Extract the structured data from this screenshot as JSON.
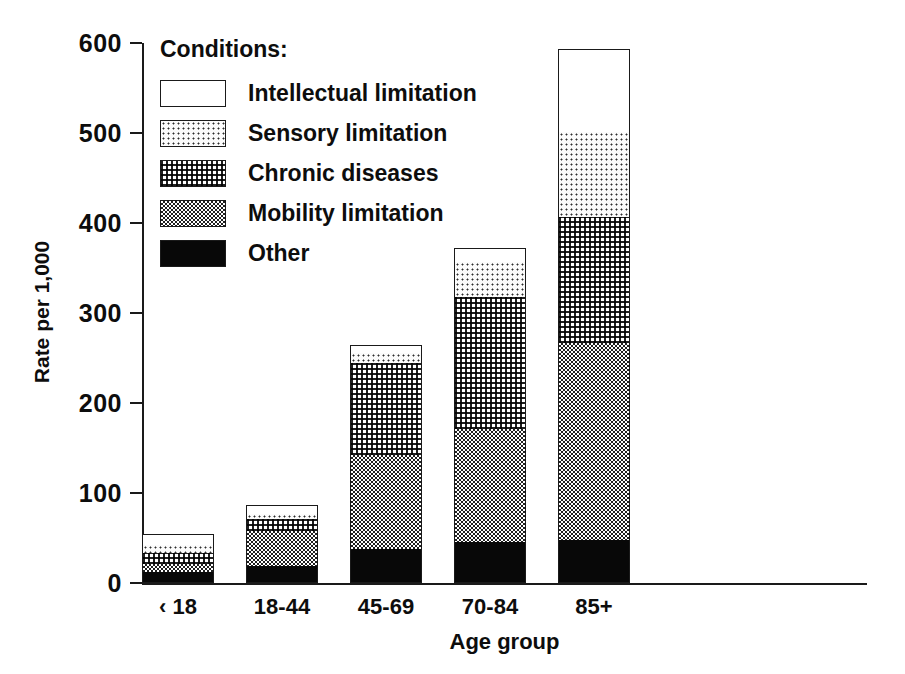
{
  "chart_data": {
    "type": "bar",
    "stacked": true,
    "title": "",
    "xlabel": "Age group",
    "ylabel": "Rate per 1,000",
    "categories": [
      "‹ 18",
      "18-44",
      "45-69",
      "70-84",
      "85+"
    ],
    "ylim": [
      0,
      600
    ],
    "yticks": [
      0,
      100,
      200,
      300,
      400,
      500,
      600
    ],
    "ytick_labels": [
      "0",
      "100",
      "200",
      "300",
      "400",
      "500",
      "600"
    ],
    "grid": false,
    "legend_title": "Conditions:",
    "legend_position": "top-left-inside",
    "series": [
      {
        "name": "Other",
        "pattern": "solid-black",
        "values": [
          12,
          19,
          38,
          46,
          48
        ]
      },
      {
        "name": "Mobility limitation",
        "pattern": "dense-checker",
        "values": [
          9,
          39,
          104,
          125,
          219
        ]
      },
      {
        "name": "Chronic diseases",
        "pattern": "dot-grid",
        "values": [
          12,
          13,
          102,
          147,
          140
        ]
      },
      {
        "name": "Sensory limitation",
        "pattern": "light-dots",
        "values": [
          9,
          6,
          12,
          39,
          94
        ]
      },
      {
        "name": "Intellectual limitation",
        "pattern": "white",
        "values": [
          12,
          10,
          9,
          15,
          92
        ]
      }
    ],
    "totals": [
      54,
      87,
      265,
      372,
      593
    ],
    "units": "Rate per 1,000"
  },
  "axes": {
    "y_title": "Rate per 1,000",
    "x_title": "Age group"
  },
  "legend": {
    "title": "Conditions:",
    "items": [
      {
        "label": "Intellectual limitation",
        "pattern": "white"
      },
      {
        "label": "Sensory limitation",
        "pattern": "light-dots"
      },
      {
        "label": "Chronic diseases",
        "pattern": "dot-grid"
      },
      {
        "label": "Mobility limitation",
        "pattern": "dense-checker"
      },
      {
        "label": "Other",
        "pattern": "solid-black"
      }
    ]
  },
  "colors": {
    "ink": "#111111",
    "paper": "#ffffff",
    "solid_black": "#080808"
  }
}
